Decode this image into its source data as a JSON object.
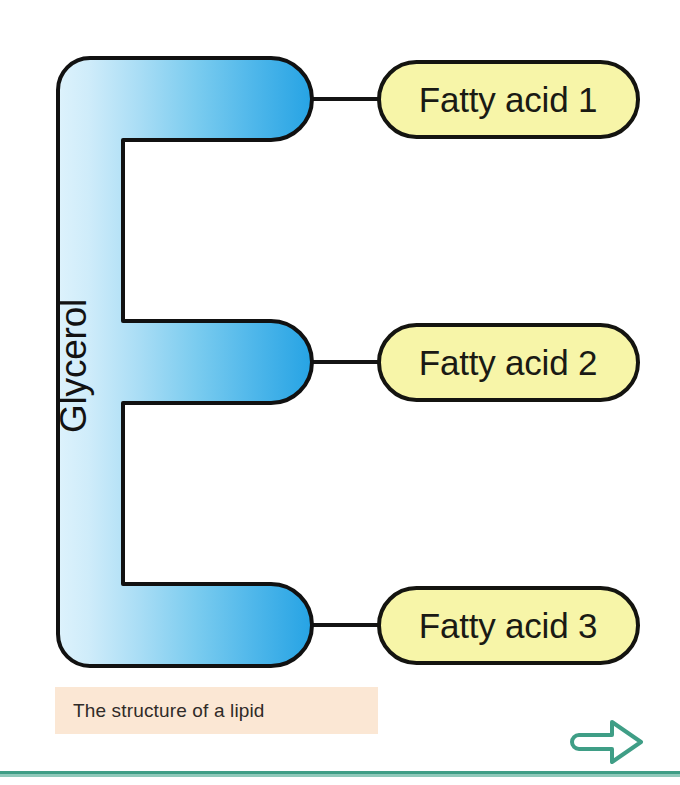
{
  "figure": {
    "title": "The structure of a lipid",
    "backbone": {
      "label": "Glycerol",
      "shape": "comb-three-prong",
      "gradient_from": "#d9f0fb",
      "gradient_to": "#2ba5e6",
      "stroke": "#111111"
    },
    "branches": [
      {
        "label": "Fatty acid 1",
        "fill": "#f7f5a8",
        "stroke": "#141410"
      },
      {
        "label": "Fatty acid 2",
        "fill": "#f7f5a8",
        "stroke": "#141410"
      },
      {
        "label": "Fatty acid 3",
        "fill": "#f7f5a8",
        "stroke": "#141410"
      }
    ],
    "connectors": 3
  },
  "caption": {
    "text": "The structure of a lipid",
    "background": "#fbe7d4",
    "color": "#2f2b28"
  },
  "footer": {
    "rule_color": "#3f9e86",
    "next_icon": "arrow-right-icon",
    "next_color": "#3f9e86"
  }
}
